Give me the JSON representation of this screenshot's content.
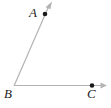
{
  "figure": {
    "name": "angle-abc-diagram",
    "type": "geometry-angle-diagram",
    "background_color": "#ffffff",
    "line_color": "#b3b3b3",
    "point_color": "#1a1a1a",
    "label_color": "#232323"
  },
  "labels": {
    "a": "A",
    "b": "B",
    "c": "C"
  },
  "points": {
    "A": {
      "label": "A",
      "x": 45,
      "y": 14
    },
    "B": {
      "label": "B",
      "x": 14,
      "y": 86
    },
    "C": {
      "label": "C",
      "x": 92,
      "y": 85
    }
  },
  "rays": [
    {
      "name": "ray-BA",
      "from": "B",
      "through": "A",
      "arrow_tip": {
        "x": 52,
        "y": 2
      },
      "has_arrowhead": true
    },
    {
      "name": "ray-BC",
      "from": "B",
      "through": "C",
      "arrow_tip": {
        "x": 107,
        "y": 85
      },
      "has_arrowhead": true
    }
  ]
}
